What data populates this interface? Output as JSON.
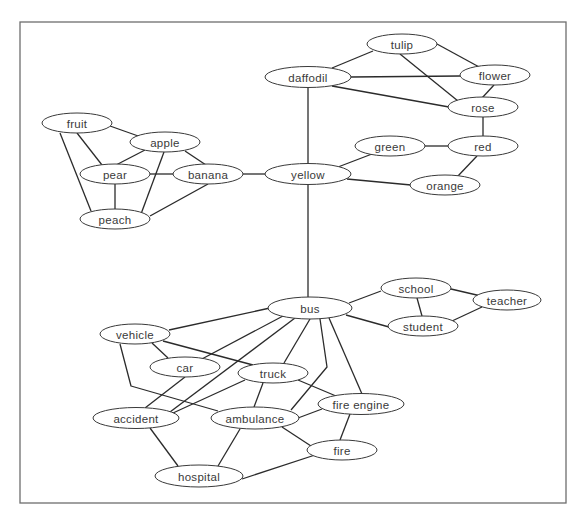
{
  "diagram": {
    "type": "semantic-network",
    "frame": {
      "x": 20,
      "y": 22,
      "width": 546,
      "height": 481
    },
    "nodes": [
      {
        "id": "tulip",
        "label": "tulip",
        "cx": 402,
        "cy": 44,
        "rx": 35,
        "ry": 10
      },
      {
        "id": "daffodil",
        "label": "daffodil",
        "cx": 308,
        "cy": 77,
        "rx": 43,
        "ry": 10.5
      },
      {
        "id": "flower",
        "label": "flower",
        "cx": 495,
        "cy": 75,
        "rx": 35,
        "ry": 10
      },
      {
        "id": "rose",
        "label": "rose",
        "cx": 483,
        "cy": 107,
        "rx": 35,
        "ry": 10
      },
      {
        "id": "green",
        "label": "green",
        "cx": 390,
        "cy": 146,
        "rx": 35,
        "ry": 10
      },
      {
        "id": "red",
        "label": "red",
        "cx": 483,
        "cy": 146,
        "rx": 35,
        "ry": 10
      },
      {
        "id": "yellow",
        "label": "yellow",
        "cx": 308,
        "cy": 174,
        "rx": 43,
        "ry": 10.5
      },
      {
        "id": "orange",
        "label": "orange",
        "cx": 445,
        "cy": 185,
        "rx": 35,
        "ry": 10
      },
      {
        "id": "fruit",
        "label": "fruit",
        "cx": 77,
        "cy": 123,
        "rx": 35,
        "ry": 10
      },
      {
        "id": "apple",
        "label": "apple",
        "cx": 165,
        "cy": 142,
        "rx": 35,
        "ry": 10
      },
      {
        "id": "pear",
        "label": "pear",
        "cx": 115,
        "cy": 174,
        "rx": 35,
        "ry": 10
      },
      {
        "id": "banana",
        "label": "banana",
        "cx": 208,
        "cy": 174,
        "rx": 35,
        "ry": 10
      },
      {
        "id": "peach",
        "label": "peach",
        "cx": 115,
        "cy": 219,
        "rx": 35,
        "ry": 10
      },
      {
        "id": "bus",
        "label": "bus",
        "cx": 310,
        "cy": 308,
        "rx": 42,
        "ry": 11
      },
      {
        "id": "school",
        "label": "school",
        "cx": 416,
        "cy": 288,
        "rx": 35,
        "ry": 10
      },
      {
        "id": "teacher",
        "label": "teacher",
        "cx": 507,
        "cy": 300,
        "rx": 34,
        "ry": 10
      },
      {
        "id": "student",
        "label": "student",
        "cx": 423,
        "cy": 326,
        "rx": 35,
        "ry": 10
      },
      {
        "id": "vehicle",
        "label": "vehicle",
        "cx": 135,
        "cy": 334,
        "rx": 35,
        "ry": 10
      },
      {
        "id": "car",
        "label": "car",
        "cx": 185,
        "cy": 367,
        "rx": 35,
        "ry": 10
      },
      {
        "id": "truck",
        "label": "truck",
        "cx": 273,
        "cy": 373,
        "rx": 35,
        "ry": 10
      },
      {
        "id": "accident",
        "label": "accident",
        "cx": 136,
        "cy": 418,
        "rx": 43,
        "ry": 10.5
      },
      {
        "id": "ambulance",
        "label": "ambulance",
        "cx": 255,
        "cy": 418,
        "rx": 44,
        "ry": 11
      },
      {
        "id": "fire_engine",
        "label": "fire engine",
        "cx": 361,
        "cy": 404,
        "rx": 43,
        "ry": 10.5
      },
      {
        "id": "fire",
        "label": "fire",
        "cx": 342,
        "cy": 450,
        "rx": 35,
        "ry": 10
      },
      {
        "id": "hospital",
        "label": "hospital",
        "cx": 199,
        "cy": 476,
        "rx": 44,
        "ry": 11
      }
    ],
    "edges": [
      {
        "from": "daffodil",
        "to": "tulip",
        "points": [
          [
            332,
            68
          ],
          [
            373,
            51
          ]
        ]
      },
      {
        "from": "daffodil",
        "to": "flower",
        "points": [
          [
            351,
            77
          ],
          [
            460,
            76
          ]
        ]
      },
      {
        "from": "daffodil",
        "to": "rose",
        "points": [
          [
            332,
            86
          ],
          [
            449,
            107
          ]
        ]
      },
      {
        "from": "tulip",
        "to": "flower",
        "points": [
          [
            437,
            44
          ],
          [
            481,
            68
          ]
        ]
      },
      {
        "from": "tulip",
        "to": "rose",
        "points": [
          [
            400,
            54
          ],
          [
            458,
            101
          ]
        ]
      },
      {
        "from": "flower",
        "to": "rose",
        "points": [
          [
            494,
            85
          ],
          [
            482,
            98
          ]
        ]
      },
      {
        "from": "rose",
        "to": "red",
        "points": [
          [
            483,
            117
          ],
          [
            483,
            136
          ]
        ]
      },
      {
        "from": "daffodil",
        "to": "yellow",
        "points": [
          [
            308,
            87
          ],
          [
            308,
            164
          ]
        ]
      },
      {
        "from": "green",
        "to": "red",
        "points": [
          [
            425,
            146
          ],
          [
            448,
            146
          ]
        ]
      },
      {
        "from": "red",
        "to": "orange",
        "points": [
          [
            477,
            156
          ],
          [
            457,
            177
          ]
        ]
      },
      {
        "from": "yellow",
        "to": "green",
        "points": [
          [
            338,
            167
          ],
          [
            372,
            154
          ]
        ]
      },
      {
        "from": "yellow",
        "to": "orange",
        "points": [
          [
            347,
            179
          ],
          [
            411,
            185
          ]
        ]
      },
      {
        "from": "banana",
        "to": "yellow",
        "points": [
          [
            243,
            174
          ],
          [
            265,
            174
          ]
        ]
      },
      {
        "from": "fruit",
        "to": "apple",
        "points": [
          [
            110,
            126
          ],
          [
            141,
            137
          ]
        ]
      },
      {
        "from": "fruit",
        "to": "pear",
        "points": [
          [
            77,
            133
          ],
          [
            102,
            165
          ]
        ]
      },
      {
        "from": "fruit",
        "to": "peach",
        "points": [
          [
            60,
            133
          ],
          [
            91,
            211
          ]
        ]
      },
      {
        "from": "apple",
        "to": "pear",
        "points": [
          [
            145,
            150
          ],
          [
            116,
            165
          ]
        ]
      },
      {
        "from": "apple",
        "to": "banana",
        "points": [
          [
            185,
            151
          ],
          [
            206,
            165
          ]
        ]
      },
      {
        "from": "apple",
        "to": "peach",
        "points": [
          [
            164,
            152
          ],
          [
            141,
            214
          ]
        ]
      },
      {
        "from": "pear",
        "to": "banana",
        "points": [
          [
            150,
            174
          ],
          [
            173,
            174
          ]
        ]
      },
      {
        "from": "pear",
        "to": "peach",
        "points": [
          [
            115,
            184
          ],
          [
            115,
            209
          ]
        ]
      },
      {
        "from": "banana",
        "to": "peach",
        "points": [
          [
            208,
            184
          ],
          [
            150,
            216
          ]
        ]
      },
      {
        "from": "yellow",
        "to": "bus",
        "points": [
          [
            308,
            185
          ],
          [
            308,
            297
          ]
        ]
      },
      {
        "from": "bus",
        "to": "school",
        "points": [
          [
            349,
            303
          ],
          [
            381,
            291
          ]
        ]
      },
      {
        "from": "bus",
        "to": "student",
        "points": [
          [
            346,
            315
          ],
          [
            389,
            327
          ]
        ]
      },
      {
        "from": "school",
        "to": "student",
        "points": [
          [
            417,
            298
          ],
          [
            422,
            316
          ]
        ]
      },
      {
        "from": "school",
        "to": "teacher",
        "points": [
          [
            451,
            289
          ],
          [
            481,
            296
          ]
        ]
      },
      {
        "from": "student",
        "to": "teacher",
        "points": [
          [
            452,
            321
          ],
          [
            482,
            307
          ]
        ]
      },
      {
        "from": "bus",
        "to": "vehicle",
        "points": [
          [
            270,
            308
          ],
          [
            169,
            330
          ]
        ]
      },
      {
        "from": "bus",
        "to": "car",
        "points": [
          [
            283,
            316
          ],
          [
            200,
            360
          ]
        ]
      },
      {
        "from": "bus",
        "to": "accident",
        "points": [
          [
            295,
            318
          ],
          [
            170,
            412
          ]
        ]
      },
      {
        "from": "bus",
        "to": "truck",
        "points": [
          [
            310,
            319
          ],
          [
            284,
            363
          ]
        ]
      },
      {
        "from": "bus",
        "to": "ambulance",
        "points": [
          [
            320,
            319
          ],
          [
            327,
            367
          ],
          [
            291,
            410
          ]
        ]
      },
      {
        "from": "bus",
        "to": "fire_engine",
        "points": [
          [
            329,
            318
          ],
          [
            362,
            394
          ]
        ]
      },
      {
        "from": "vehicle",
        "to": "car",
        "points": [
          [
            152,
            343
          ],
          [
            168,
            358
          ]
        ]
      },
      {
        "from": "vehicle",
        "to": "truck",
        "points": [
          [
            163,
            341
          ],
          [
            253,
            365
          ]
        ]
      },
      {
        "from": "vehicle",
        "to": "ambulance",
        "points": [
          [
            120,
            344
          ],
          [
            131,
            386
          ],
          [
            218,
            411
          ]
        ]
      },
      {
        "from": "car",
        "to": "accident",
        "points": [
          [
            185,
            377
          ],
          [
            145,
            408
          ]
        ]
      },
      {
        "from": "truck",
        "to": "accident",
        "points": [
          [
            245,
            380
          ],
          [
            173,
            413
          ]
        ]
      },
      {
        "from": "truck",
        "to": "ambulance",
        "points": [
          [
            263,
            383
          ],
          [
            254,
            407
          ]
        ]
      },
      {
        "from": "truck",
        "to": "fire_engine",
        "points": [
          [
            298,
            380
          ],
          [
            336,
            396
          ]
        ]
      },
      {
        "from": "ambulance",
        "to": "fire_engine",
        "points": [
          [
            298,
            418
          ],
          [
            322,
            409
          ]
        ]
      },
      {
        "from": "ambulance",
        "to": "fire",
        "points": [
          [
            282,
            427
          ],
          [
            311,
            446
          ]
        ]
      },
      {
        "from": "fire_engine",
        "to": "fire",
        "points": [
          [
            350,
            414
          ],
          [
            340,
            440
          ]
        ]
      },
      {
        "from": "ambulance",
        "to": "hospital",
        "points": [
          [
            240,
            429
          ],
          [
            218,
            466
          ]
        ]
      },
      {
        "from": "accident",
        "to": "hospital",
        "points": [
          [
            150,
            428
          ],
          [
            178,
            466
          ]
        ]
      },
      {
        "from": "hospital",
        "to": "fire",
        "points": [
          [
            242,
            479
          ],
          [
            315,
            455
          ]
        ]
      }
    ]
  }
}
